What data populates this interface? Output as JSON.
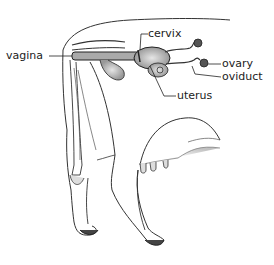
{
  "diagram": {
    "labels": [
      {
        "id": "vagina",
        "text": "vagina"
      },
      {
        "id": "cervix",
        "text": "cervix"
      },
      {
        "id": "ovary",
        "text": "ovary"
      },
      {
        "id": "oviduct",
        "text": "oviduct"
      },
      {
        "id": "uterus",
        "text": "uterus"
      }
    ],
    "colors": {
      "line": "#222222",
      "shade": "#bbbbbb",
      "background": "#ffffff"
    }
  }
}
